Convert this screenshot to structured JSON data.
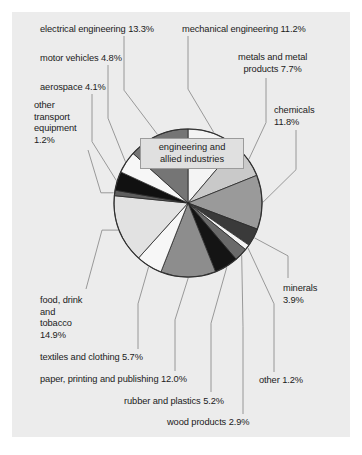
{
  "figure": {
    "background_color": "#ececec",
    "page_background": "#ffffff",
    "callout_label": "engineering and\nallied industries",
    "callout_fill": "#e0e0e0",
    "callout_border": "#9b9b9b"
  },
  "chart_data": {
    "type": "pie",
    "title": "",
    "subtitle": "",
    "xlabel": "",
    "ylabel": "",
    "grid": false,
    "legend_position": "callout-labels-around-pie",
    "units": "percent",
    "total": 100.0,
    "center_callout": "engineering and allied industries",
    "start_angle_deg": -90,
    "direction": "clockwise",
    "categories": [
      "mechanical engineering",
      "metals and metal products",
      "chemicals",
      "minerals",
      "other",
      "wood products",
      "rubber and plastics",
      "paper, printing and publishing",
      "textiles and clothing",
      "food, drink and tobacco",
      "other transport equipment",
      "aerospace",
      "motor vehicles",
      "electrical engineering"
    ],
    "values": [
      11.2,
      7.7,
      11.8,
      3.9,
      1.2,
      2.9,
      5.2,
      12.0,
      5.7,
      14.9,
      1.2,
      4.1,
      4.8,
      13.3
    ],
    "colors": [
      "#f4f4f4",
      "#c9c9c9",
      "#9a9a9a",
      "#3a3a3a",
      "#f4f4f4",
      "#6a6a6a",
      "#141414",
      "#8d8d8d",
      "#f7f7f7",
      "#e2e2e2",
      "#5e5e5e",
      "#111111",
      "#f7f7f7",
      "#757575"
    ],
    "slice_border_color": "#2a2a2a",
    "slices": [
      {
        "label": "mechanical engineering",
        "value": 11.2,
        "display": "mechanical engineering 11.2%",
        "color": "#f4f4f4"
      },
      {
        "label": "metals and metal products",
        "value": 7.7,
        "display": "metals and metal products 7.7%",
        "color": "#c9c9c9"
      },
      {
        "label": "chemicals",
        "value": 11.8,
        "display": "chemicals 11.8%",
        "color": "#9a9a9a"
      },
      {
        "label": "minerals",
        "value": 3.9,
        "display": "minerals 3.9%",
        "color": "#3a3a3a"
      },
      {
        "label": "other",
        "value": 1.2,
        "display": "other 1.2%",
        "color": "#f4f4f4"
      },
      {
        "label": "wood products",
        "value": 2.9,
        "display": "wood products 2.9%",
        "color": "#6a6a6a"
      },
      {
        "label": "rubber and plastics",
        "value": 5.2,
        "display": "rubber and plastics 5.2%",
        "color": "#141414"
      },
      {
        "label": "paper, printing and publishing",
        "value": 12.0,
        "display": "paper, printing and publishing 12.0%",
        "color": "#8d8d8d"
      },
      {
        "label": "textiles and clothing",
        "value": 5.7,
        "display": "textiles and clothing 5.7%",
        "color": "#f7f7f7"
      },
      {
        "label": "food, drink and tobacco",
        "value": 14.9,
        "display": "food, drink and tobacco 14.9%",
        "color": "#e2e2e2"
      },
      {
        "label": "other transport equipment",
        "value": 1.2,
        "display": "other transport equipment 1.2%",
        "color": "#5e5e5e"
      },
      {
        "label": "aerospace",
        "value": 4.1,
        "display": "aerospace 4.1%",
        "color": "#111111"
      },
      {
        "label": "motor vehicles",
        "value": 4.8,
        "display": "motor vehicles 4.8%",
        "color": "#f7f7f7"
      },
      {
        "label": "electrical engineering",
        "value": 13.3,
        "display": "electrical engineering 13.3%",
        "color": "#757575"
      }
    ]
  },
  "labels": {
    "electrical_engineering": "electrical engineering 13.3%",
    "motor_vehicles": "motor vehicles 4.8%",
    "aerospace": "aerospace 4.1%",
    "other_transport_equipment": "other\ntransport\nequipment\n1.2%",
    "mechanical_engineering": "mechanical engineering 11.2%",
    "metals_and_metal_products": "metals and metal\nproducts 7.7%",
    "chemicals": "chemicals\n11.8%",
    "minerals": "minerals\n3.9%",
    "other": "other 1.2%",
    "wood_products": "wood products 2.9%",
    "rubber_and_plastics": "rubber and plastics 5.2%",
    "paper_printing_publishing": "paper, printing and publishing 12.0%",
    "textiles_and_clothing": "textiles and clothing 5.7%",
    "food_drink_tobacco": "food, drink\nand\ntobacco\n14.9%"
  }
}
